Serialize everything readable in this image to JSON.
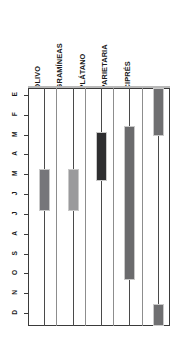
{
  "chart_data": {
    "type": "bar",
    "title": "",
    "subtitle": "",
    "xlabel": "",
    "ylabel": "",
    "orientation": "vertical-gantt",
    "grid": true,
    "legend_position": "none",
    "categories": [
      "OLIVO",
      "GRAMÍNEAS",
      "PLÁTANO",
      "PARIETARIA",
      "CIPRÉS"
    ],
    "month_ticks": [
      "E",
      "F",
      "M",
      "A",
      "M",
      "J",
      "J",
      "A",
      "S",
      "O",
      "N",
      "D"
    ],
    "month_names": [
      "Enero",
      "Febrero",
      "Marzo",
      "Abril",
      "Mayo",
      "Junio",
      "Julio",
      "Agosto",
      "Septiembre",
      "Octubre",
      "Noviembre",
      "Diciembre"
    ],
    "ylim": [
      1,
      12
    ],
    "series": [
      {
        "name": "OLIVO",
        "color": "#76767a",
        "intervals": [
          {
            "start_month": 5.1,
            "end_month": 6.6
          }
        ]
      },
      {
        "name": "GRAMÍNEAS",
        "color": "#9a9a9c",
        "intervals": [
          {
            "start_month": 5.1,
            "end_month": 6.6
          }
        ]
      },
      {
        "name": "PLÁTANO",
        "color": "#2e2e30",
        "intervals": [
          {
            "start_month": 3.2,
            "end_month": 5.1
          }
        ]
      },
      {
        "name": "PARIETARIA",
        "color": "#6b6b6d",
        "intervals": [
          {
            "start_month": 2.9,
            "end_month": 10.1
          }
        ]
      },
      {
        "name": "CIPRÉS",
        "color": "#6f6f71",
        "intervals": [
          {
            "start_month": 1.0,
            "end_month": 2.8
          },
          {
            "start_month": 11.9,
            "end_month": 12.9
          }
        ]
      }
    ]
  },
  "axis": {
    "months": [
      {
        "key": "E",
        "label": "E",
        "index": 1
      },
      {
        "key": "F",
        "label": "F",
        "index": 2
      },
      {
        "key": "M1",
        "label": "M",
        "index": 3
      },
      {
        "key": "A1",
        "label": "A",
        "index": 4
      },
      {
        "key": "M2",
        "label": "M",
        "index": 5
      },
      {
        "key": "J1",
        "label": "J",
        "index": 6
      },
      {
        "key": "J2",
        "label": "J",
        "index": 7
      },
      {
        "key": "A2",
        "label": "A",
        "index": 8
      },
      {
        "key": "S",
        "label": "S",
        "index": 9
      },
      {
        "key": "O",
        "label": "O",
        "index": 10
      },
      {
        "key": "N",
        "label": "N",
        "index": 11
      },
      {
        "key": "D",
        "label": "D",
        "index": 12
      }
    ]
  },
  "species": [
    {
      "label": "OLIVO"
    },
    {
      "label": "GRAMÍNEAS"
    },
    {
      "label": "PLÁTANO"
    },
    {
      "label": "PARIETARIA"
    },
    {
      "label": "CIPRÉS"
    }
  ]
}
